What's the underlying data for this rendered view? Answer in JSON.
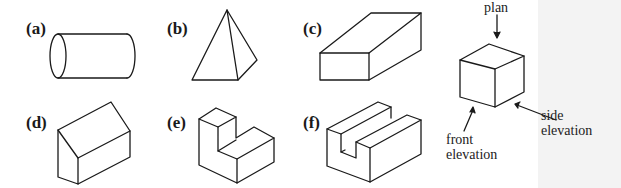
{
  "figure": {
    "shapes": [
      {
        "id": "a",
        "label": "(a)",
        "solid": "cylinder"
      },
      {
        "id": "b",
        "label": "(b)",
        "solid": "pyramid"
      },
      {
        "id": "c",
        "label": "(c)",
        "solid": "rectangular block"
      },
      {
        "id": "d",
        "label": "(d)",
        "solid": "wedge-roofed block"
      },
      {
        "id": "e",
        "label": "(e)",
        "solid": "L-shaped block"
      },
      {
        "id": "f",
        "label": "(f)",
        "solid": "slotted block"
      }
    ],
    "cube_annotations": {
      "plan": "plan",
      "side_elevation_line1": "side",
      "side_elevation_line2": "elevation",
      "front_elevation_line1": "front",
      "front_elevation_line2": "elevation"
    },
    "colors": {
      "stroke": "#1a1a1a",
      "background": "#ffffff"
    }
  }
}
